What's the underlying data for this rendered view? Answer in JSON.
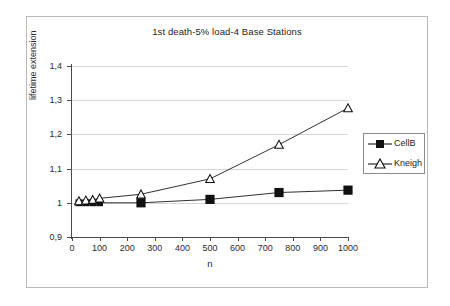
{
  "chart_data": {
    "type": "line",
    "title": "1st death-5% load-4 Base Stations",
    "xlabel": "n",
    "ylabel": "lifetime extension",
    "xlim": [
      0,
      1000
    ],
    "ylim": [
      0.9,
      1.4
    ],
    "grid": true,
    "legend_position": "right",
    "decimal_separator": ",",
    "xticks": [
      0,
      100,
      200,
      300,
      400,
      500,
      600,
      700,
      800,
      900,
      1000
    ],
    "xtick_labels": [
      "0",
      "100",
      "200",
      "300",
      "400",
      "500",
      "600",
      "700",
      "800",
      "900",
      "1000"
    ],
    "yticks": [
      0.9,
      1.0,
      1.1,
      1.2,
      1.3,
      1.4
    ],
    "ytick_labels": [
      "0,9",
      "1",
      "1,1",
      "1,2",
      "1,3",
      "1,4"
    ],
    "series": [
      {
        "name": "CellB",
        "marker": "filled-square",
        "color": "#1a1a1a",
        "x": [
          25,
          50,
          75,
          100,
          250,
          500,
          750,
          1000
        ],
        "values": [
          1.0,
          1.0,
          1.0,
          1.0,
          1.0,
          1.01,
          1.03,
          1.037
        ]
      },
      {
        "name": "Kneigh",
        "marker": "open-triangle",
        "color": "#1a1a1a",
        "x": [
          25,
          50,
          75,
          100,
          250,
          500,
          750,
          1000
        ],
        "values": [
          1.005,
          1.007,
          1.009,
          1.013,
          1.025,
          1.07,
          1.17,
          1.277
        ]
      }
    ]
  },
  "legend": {
    "items": [
      {
        "label": "CellB"
      },
      {
        "label": "Kneigh"
      }
    ]
  }
}
